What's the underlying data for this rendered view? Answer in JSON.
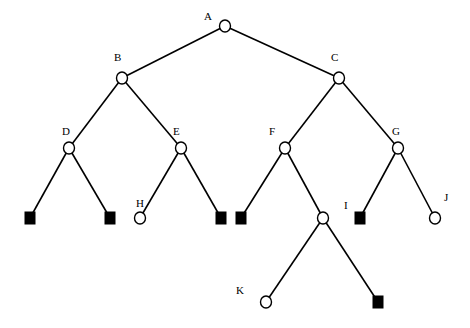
{
  "diagram": {
    "type": "game-tree",
    "nodes": [
      {
        "id": "A",
        "label": "A",
        "shape": "circle"
      },
      {
        "id": "B",
        "label": "B",
        "shape": "circle"
      },
      {
        "id": "C",
        "label": "C",
        "shape": "circle"
      },
      {
        "id": "D",
        "label": "D",
        "shape": "circle"
      },
      {
        "id": "E",
        "label": "E",
        "shape": "circle"
      },
      {
        "id": "F",
        "label": "F",
        "shape": "circle"
      },
      {
        "id": "G",
        "label": "G",
        "shape": "circle"
      },
      {
        "id": "D1",
        "label": "",
        "shape": "square"
      },
      {
        "id": "D2",
        "label": "",
        "shape": "square"
      },
      {
        "id": "H",
        "label": "H",
        "shape": "circle"
      },
      {
        "id": "E2",
        "label": "",
        "shape": "square"
      },
      {
        "id": "F1",
        "label": "",
        "shape": "square"
      },
      {
        "id": "F2",
        "label": "",
        "shape": "circle"
      },
      {
        "id": "I",
        "label": "I",
        "shape": "square"
      },
      {
        "id": "J",
        "label": "J",
        "shape": "circle"
      },
      {
        "id": "K",
        "label": "K",
        "shape": "circle"
      },
      {
        "id": "F2b",
        "label": "",
        "shape": "square"
      }
    ],
    "edges": [
      [
        "A",
        "B"
      ],
      [
        "A",
        "C"
      ],
      [
        "B",
        "D"
      ],
      [
        "B",
        "E"
      ],
      [
        "C",
        "F"
      ],
      [
        "C",
        "G"
      ],
      [
        "D",
        "D1"
      ],
      [
        "D",
        "D2"
      ],
      [
        "E",
        "H"
      ],
      [
        "E",
        "E2"
      ],
      [
        "F",
        "F1"
      ],
      [
        "F",
        "F2"
      ],
      [
        "G",
        "I"
      ],
      [
        "G",
        "J"
      ],
      [
        "F2",
        "K"
      ],
      [
        "F2",
        "F2b"
      ]
    ]
  }
}
